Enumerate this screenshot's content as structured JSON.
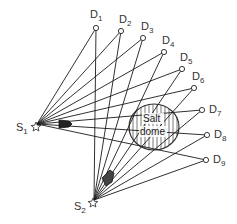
{
  "diagram": {
    "type": "seismic-ray-geometry",
    "sources": [
      {
        "id": "S1",
        "label": "S",
        "sub": "1",
        "x": 37,
        "y": 124
      },
      {
        "id": "S2",
        "label": "S",
        "sub": "2",
        "x": 94,
        "y": 200
      }
    ],
    "detectors": [
      {
        "id": "D1",
        "label": "D",
        "sub": "1",
        "x": 96,
        "y": 28
      },
      {
        "id": "D2",
        "label": "D",
        "sub": "2",
        "x": 121,
        "y": 31
      },
      {
        "id": "D3",
        "label": "D",
        "sub": "3",
        "x": 143,
        "y": 38
      },
      {
        "id": "D4",
        "label": "D",
        "sub": "4",
        "x": 164,
        "y": 52
      },
      {
        "id": "D5",
        "label": "D",
        "sub": "5",
        "x": 182,
        "y": 69
      },
      {
        "id": "D6",
        "label": "D",
        "sub": "6",
        "x": 194,
        "y": 88
      },
      {
        "id": "D7",
        "label": "D",
        "sub": "7",
        "x": 202,
        "y": 110
      },
      {
        "id": "D8",
        "label": "D",
        "sub": "8",
        "x": 207,
        "y": 135
      },
      {
        "id": "D9",
        "label": "D",
        "sub": "9",
        "x": 206,
        "y": 160
      }
    ],
    "salt_dome": {
      "label_line1": "Salt",
      "label_line2": "dome",
      "cx": 154,
      "cy": 127,
      "rx": 25,
      "ry": 23
    },
    "colors": {
      "line": "#1a1a1a",
      "hatch": "#555555",
      "background": "#ffffff"
    }
  }
}
